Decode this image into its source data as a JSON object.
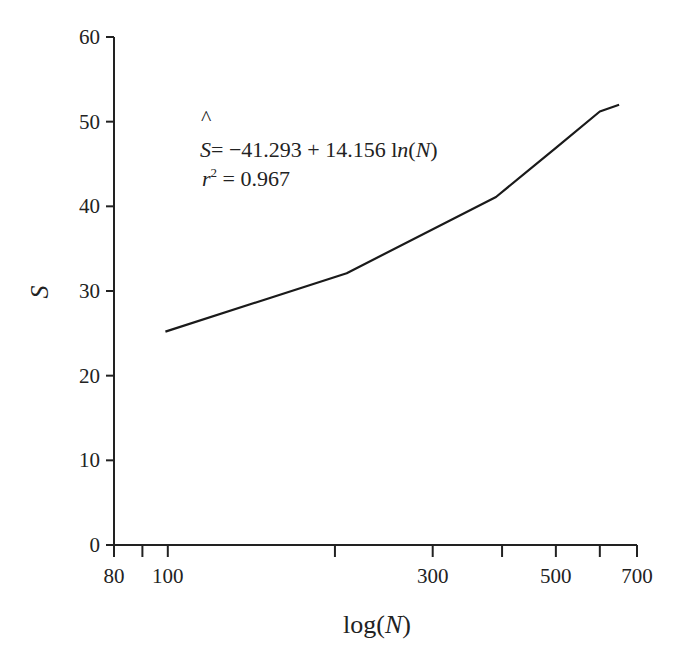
{
  "chart_data": {
    "type": "line",
    "title": "",
    "xlabel": "log(N)",
    "ylabel": "S",
    "xscale": "log",
    "xlim": [
      80,
      700
    ],
    "ylim": [
      0,
      60
    ],
    "grid": false,
    "x_ticks": [
      80,
      90,
      100,
      200,
      300,
      400,
      500,
      600,
      700
    ],
    "x_tick_labels": [
      {
        "value": 80,
        "label": "80"
      },
      {
        "value": 100,
        "label": "100"
      },
      {
        "value": 300,
        "label": "300"
      },
      {
        "value": 500,
        "label": "500"
      },
      {
        "value": 700,
        "label": "700"
      }
    ],
    "y_ticks": [
      0,
      10,
      20,
      30,
      40,
      50,
      60
    ],
    "y_tick_labels": [
      "0",
      "10",
      "20",
      "30",
      "40",
      "50",
      "60"
    ],
    "series": [
      {
        "name": "S",
        "x": [
          99,
          210,
          390,
          500,
          600,
          650
        ],
        "y": [
          25.2,
          32.1,
          41.1,
          46.9,
          51.2,
          52.0
        ]
      }
    ],
    "annotations": {
      "equation": {
        "lhs": "S",
        "hat": "^",
        "rhs_prefix": "= −41.293 + 14.156 l",
        "rhs_italic": "n",
        "rhs_paren_open": "(",
        "rhs_var": "N",
        "rhs_paren_close": ")"
      },
      "r_squared": {
        "symbol": "r",
        "exponent": "2",
        "text": " = 0.967"
      }
    },
    "xlabel_parts": {
      "prefix": "log(",
      "var": "N",
      "suffix": ")"
    }
  }
}
